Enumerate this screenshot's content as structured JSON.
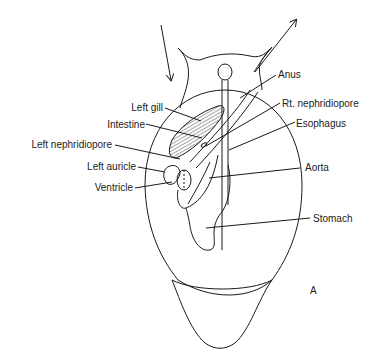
{
  "diagram": {
    "panel_letter": "A",
    "labels": {
      "left_gill": "Left gill",
      "intestine": "Intestine",
      "left_nephridiopore": "Left nephridiopore",
      "left_auricle": "Left auricle",
      "ventricle": "Ventricle",
      "anus": "Anus",
      "rt_nephridiopore": "Rt. nephridiopore",
      "esophagus": "Esophagus",
      "aorta": "Aorta",
      "stomach": "Stomach"
    },
    "arrows": [
      {
        "name": "inflow-arrow",
        "direction": "down"
      },
      {
        "name": "outflow-arrow",
        "direction": "up-right"
      }
    ],
    "colors": {
      "line": "#1a1a1a",
      "text": "#222222",
      "background": "#ffffff"
    }
  }
}
